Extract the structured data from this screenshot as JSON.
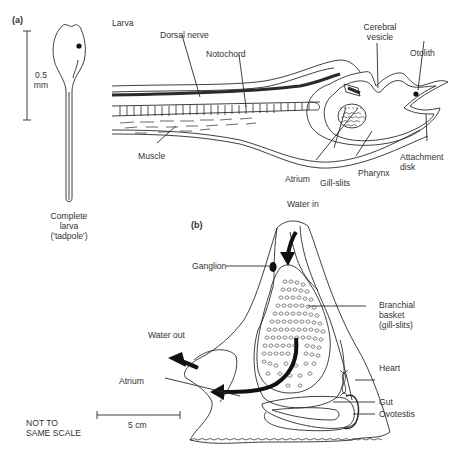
{
  "panel_a": {
    "tag": "(a)",
    "title": "Larva",
    "scale": {
      "value": "0.5",
      "unit": "mm"
    },
    "caption": [
      "Complete",
      "larva",
      "('tadpole')"
    ],
    "labels": {
      "dorsal_nerve": "Dorsal nerve",
      "notochord": "Notochord",
      "cerebral_vesicle": [
        "Cerebral",
        "vesicle"
      ],
      "otolith": "Otolith",
      "muscle": "Muscle",
      "atrium": "Atrium",
      "gill_slits": "Gill-slits",
      "pharynx": "Pharynx",
      "attachment_disk": [
        "Attachment",
        "disk"
      ]
    }
  },
  "panel_b": {
    "tag": "(b)",
    "labels": {
      "water_in": "Water in",
      "ganglion": "Ganglion",
      "branchial_basket": [
        "Branchial",
        "basket",
        "(gill-slits)"
      ],
      "water_out": "Water out",
      "heart": "Heart",
      "atrium": "Atrium",
      "gut": "Gut",
      "ovotestis": "Ovotestis"
    },
    "scale": {
      "value": "5 cm"
    }
  },
  "note": [
    "NOT TO",
    "SAME SCALE"
  ]
}
